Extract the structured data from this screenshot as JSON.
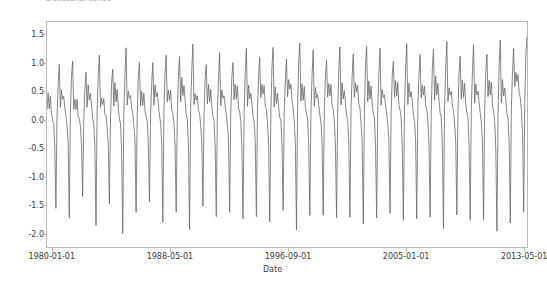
{
  "figure": {
    "title": "a seasonal series",
    "title_clipped": true,
    "background": "#ffffff",
    "axes_frame_color": "#b9b9b9",
    "tick_label_color": "#3c3c3c"
  },
  "chart_data": {
    "type": "line",
    "title": "a seasonal series",
    "xlabel": "Date",
    "ylabel": "",
    "grid": false,
    "legend": null,
    "line_color": "#666666",
    "line_width": 0.8,
    "xlim": [
      "1980-01-01",
      "2015-12-01"
    ],
    "ylim": [
      -2.15,
      1.85
    ],
    "yticks": [
      1.5,
      1.0,
      0.5,
      0.0,
      -0.5,
      -1.0,
      -1.5,
      -2.0
    ],
    "ytick_labels": [
      "1.5",
      "1.0",
      "0.5",
      "0.0",
      "-0.5",
      "-1.0",
      "-1.5",
      "-2.0"
    ],
    "xticks": [
      "1980-01-01",
      "1988-05-01",
      "1996-09-01",
      "2005-01-01",
      "2013-05-01"
    ],
    "xtick_labels": [
      "1980-01-01",
      "1988-05-01",
      "1996-09-01",
      "2005-01-01",
      "2013-05-01"
    ],
    "xtick_positions_frac": [
      0.012,
      0.257,
      0.502,
      0.747,
      0.992
    ],
    "series": [
      {
        "name": "value",
        "frequency": "monthly",
        "start": "1980-01-01",
        "n_cycles": 36,
        "cycle_shape": [
          0.35,
          0.62,
          0.42,
          0.55,
          0.3,
          0.18,
          0.05,
          -0.3,
          -1.45,
          0.2,
          0.8,
          1.12
        ],
        "cycle_peaks": [
          1.05,
          1.2,
          0.92,
          1.28,
          1.02,
          1.36,
          1.18,
          1.08,
          1.3,
          1.22,
          1.45,
          1.12,
          1.26,
          1.18,
          1.34,
          1.24,
          1.4,
          1.16,
          1.52,
          1.3,
          1.22,
          1.38,
          1.28,
          1.44,
          1.34,
          1.2,
          1.42,
          1.3,
          1.36,
          1.48,
          1.28,
          1.4,
          1.32,
          1.5,
          1.38,
          1.62
        ],
        "cycle_troughs": [
          -1.48,
          -1.6,
          -1.3,
          -1.72,
          -1.42,
          -1.9,
          -1.52,
          -1.38,
          -1.66,
          -1.58,
          -1.8,
          -1.44,
          -1.62,
          -1.5,
          -1.7,
          -1.56,
          -1.74,
          -1.48,
          -1.84,
          -1.62,
          -1.54,
          -1.68,
          -1.58,
          -1.76,
          -1.64,
          -1.52,
          -1.72,
          -1.6,
          -1.66,
          -1.8,
          -1.58,
          -1.7,
          -1.62,
          -1.92,
          -1.68,
          -1.55
        ],
        "shoulder_level": 0.42,
        "description": "Strong annual sawtooth: a sharp single-month trough near -1.5 to -1.9 followed by a rapid rise to a peak near 1.0-1.6, with a mid-level shoulder plateau around 0.4 during the middle of each year."
      }
    ]
  }
}
